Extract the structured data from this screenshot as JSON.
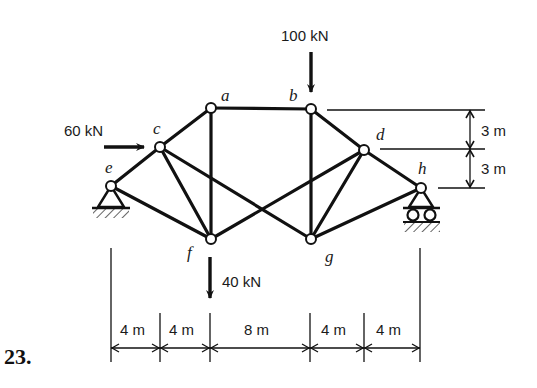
{
  "problem": {
    "number": "23."
  },
  "nodes": {
    "a": "a",
    "b": "b",
    "c": "c",
    "d": "d",
    "e": "e",
    "f": "f",
    "g": "g",
    "h": "h"
  },
  "loads": {
    "horizontal_c": "60 kN",
    "vertical_b": "100 kN",
    "vertical_f": "40 kN"
  },
  "dimensions": {
    "horizontal": [
      "4 m",
      "4 m",
      "8 m",
      "4 m",
      "4 m"
    ],
    "vertical": [
      "3 m",
      "3 m"
    ]
  },
  "members": [
    [
      "e",
      "c"
    ],
    [
      "c",
      "a"
    ],
    [
      "a",
      "b"
    ],
    [
      "b",
      "d"
    ],
    [
      "d",
      "h"
    ],
    [
      "e",
      "f"
    ],
    [
      "f",
      "g"
    ],
    [
      "g",
      "h"
    ],
    [
      "a",
      "f"
    ],
    [
      "b",
      "g"
    ],
    [
      "c",
      "f"
    ],
    [
      "d",
      "g"
    ],
    [
      "c",
      "g"
    ],
    [
      "f",
      "d"
    ]
  ],
  "supports": {
    "e": "pin",
    "h": "roller"
  },
  "colors": {
    "ink": "#111111",
    "background": "#ffffff"
  }
}
